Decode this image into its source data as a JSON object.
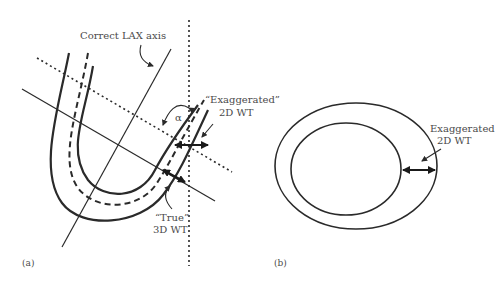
{
  "figure": {
    "panel_a": {
      "label": "(a)",
      "axis_label": "Correct LAX axis",
      "angle_symbol": "α",
      "exaggerated_label_line1": "“Exaggerated”",
      "exaggerated_label_line2": "2D WT",
      "true_label_line1": "“True”",
      "true_label_line2": "3D WT"
    },
    "panel_b": {
      "label": "(b)",
      "exaggerated_label_line1": "Exaggerated",
      "exaggerated_label_line2": "2D WT"
    },
    "colors": {
      "stroke": "#2a2a2a",
      "text": "#4a4a4a",
      "background": "#ffffff"
    }
  }
}
